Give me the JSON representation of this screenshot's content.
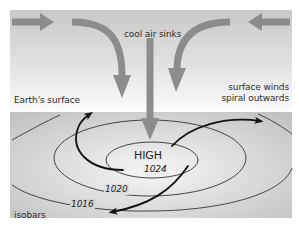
{
  "diagram": {
    "title_label": "cool air sinks",
    "surface_label": "Earth's surface",
    "winds_label_line1": "surface winds",
    "winds_label_line2": "spiral outwards",
    "center_label": "HIGH",
    "isobars_label": "isobars",
    "isobar_values": [
      "1024",
      "1020",
      "1016"
    ],
    "colors": {
      "sky_top": "#c9c9c9",
      "sky_bottom": "#ffffff",
      "ground_light": "#f4f4f4",
      "ground_dark": "#c4c4c4",
      "air_arrow": "#8c8c8c",
      "wind_arrow": "#111111",
      "isobar_line": "#333333"
    }
  }
}
